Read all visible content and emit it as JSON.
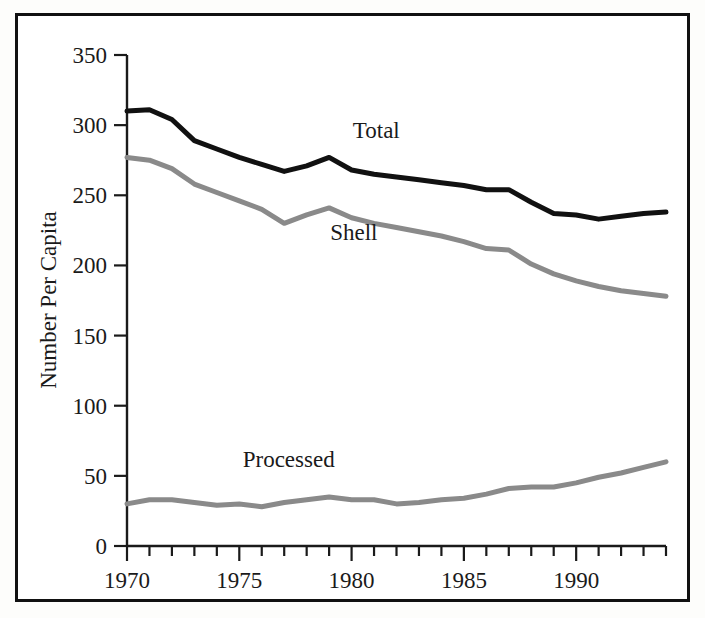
{
  "figure": {
    "background_color": "#ffffff",
    "border_color": "#111111"
  },
  "chart_data": {
    "type": "line",
    "title": "",
    "subtitle": "",
    "xlabel": "",
    "ylabel": "Number Per Capita",
    "xlim": [
      1970,
      1994
    ],
    "ylim": [
      0,
      350
    ],
    "grid": false,
    "legend_position": "inline-annotations",
    "x": [
      1970,
      1971,
      1972,
      1973,
      1974,
      1975,
      1976,
      1977,
      1978,
      1979,
      1980,
      1981,
      1982,
      1983,
      1984,
      1985,
      1986,
      1987,
      1988,
      1989,
      1990,
      1991,
      1992,
      1993,
      1994
    ],
    "xticks": [
      1970,
      1975,
      1980,
      1985,
      1990
    ],
    "xtick_labels": [
      "1970",
      "1975",
      "1980",
      "1985",
      "1990"
    ],
    "yticks": [
      0,
      50,
      100,
      150,
      200,
      250,
      300,
      350
    ],
    "ytick_labels": [
      "0",
      "50",
      "100",
      "150",
      "200",
      "250",
      "300",
      "350"
    ],
    "series": [
      {
        "name": "Total",
        "color": "#111111",
        "line_width": 5,
        "label_x": 1981.1,
        "label_y": 291,
        "values": [
          310,
          311,
          304,
          289,
          283,
          277,
          272,
          267,
          271,
          277,
          268,
          265,
          263,
          261,
          259,
          257,
          254,
          254,
          245,
          237,
          236,
          233,
          235,
          237,
          238
        ]
      },
      {
        "name": "Shell",
        "color": "#8a8a8a",
        "line_width": 5,
        "label_x": 1980.1,
        "label_y": 218,
        "values": [
          277,
          275,
          269,
          258,
          252,
          246,
          240,
          230,
          236,
          241,
          234,
          230,
          227,
          224,
          221,
          217,
          212,
          211,
          201,
          194,
          189,
          185,
          182,
          180,
          178
        ]
      },
      {
        "name": "Processed",
        "color": "#8a8a8a",
        "line_width": 5,
        "label_x": 1977.2,
        "label_y": 56,
        "values": [
          30,
          33,
          33,
          31,
          29,
          30,
          28,
          31,
          33,
          35,
          33,
          33,
          30,
          31,
          33,
          34,
          37,
          41,
          42,
          42,
          45,
          49,
          52,
          56,
          60
        ]
      }
    ]
  },
  "axis": {
    "y_title": "Number Per Capita"
  }
}
